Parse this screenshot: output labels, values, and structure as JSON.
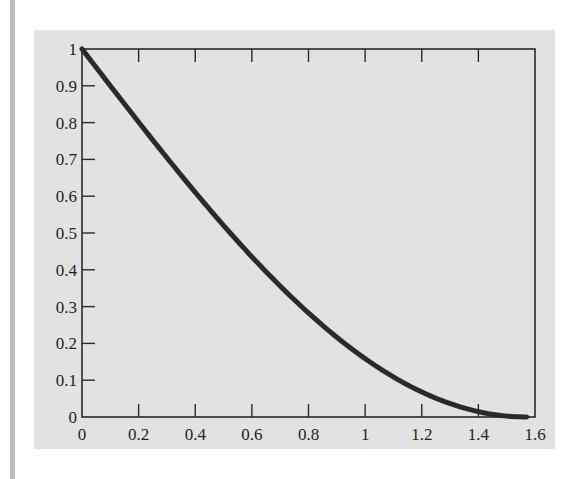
{
  "chart_data": {
    "type": "line",
    "title": "",
    "xlabel": "",
    "ylabel": "",
    "xlim": [
      0,
      1.6
    ],
    "ylim": [
      0,
      1
    ],
    "grid": false,
    "legend": null,
    "x_ticks": [
      "0",
      "0.2",
      "0.4",
      "0.6",
      "0.8",
      "1",
      "1.2",
      "1.4",
      "1.6"
    ],
    "y_ticks": [
      "0",
      "0.1",
      "0.2",
      "0.3",
      "0.4",
      "0.5",
      "0.6",
      "0.7",
      "0.8",
      "0.9",
      "1"
    ],
    "series": [
      {
        "name": "y = 1 - sin(x)",
        "color": "#2a2a2a",
        "x": [
          0,
          0.1,
          0.2,
          0.3,
          0.4,
          0.5,
          0.6,
          0.7,
          0.8,
          0.9,
          1.0,
          1.1,
          1.2,
          1.3,
          1.4,
          1.5,
          1.5708
        ],
        "y": [
          1.0,
          0.9,
          0.801,
          0.704,
          0.611,
          0.521,
          0.435,
          0.356,
          0.283,
          0.217,
          0.159,
          0.109,
          0.068,
          0.036,
          0.015,
          0.003,
          0.0
        ]
      }
    ]
  },
  "colors": {
    "panel_background": "#e2e2e2",
    "axis": "#2a2a2a",
    "curve": "#2a2a2a",
    "side_bar": "#bdbdbd"
  }
}
